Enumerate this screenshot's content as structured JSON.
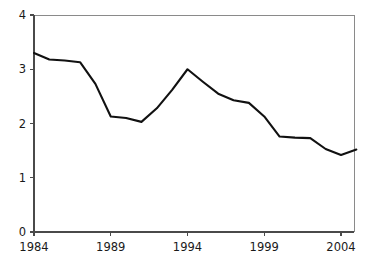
{
  "chart_data": {
    "type": "line",
    "title": "",
    "subtitle": "",
    "xlabel": "",
    "ylabel": "",
    "xlim": [
      1984,
      2005
    ],
    "ylim": [
      0,
      4
    ],
    "grid": false,
    "legend": false,
    "legend_position": "none",
    "x_ticks": [
      1984,
      1989,
      1994,
      1999,
      2004
    ],
    "x_tick_labels": [
      "1984",
      "1989",
      "1994",
      "1999",
      "2004"
    ],
    "y_ticks": [
      0,
      1,
      2,
      3,
      4
    ],
    "y_tick_labels": [
      "0",
      "1",
      "2",
      "3",
      "4"
    ],
    "line_color": "#111111",
    "axis_color": "#4a4a4a",
    "frame_color": "#8a8a8a",
    "series": [
      {
        "name": "series-1",
        "x": [
          1984,
          1985,
          1986,
          1987,
          1988,
          1989,
          1990,
          1991,
          1992,
          1993,
          1994,
          1995,
          1996,
          1997,
          1998,
          1999,
          2000,
          2001,
          2002,
          2003,
          2004,
          2005
        ],
        "values": [
          3.3,
          3.18,
          3.16,
          3.13,
          2.73,
          2.13,
          2.1,
          2.03,
          2.28,
          2.62,
          3.0,
          2.77,
          2.55,
          2.43,
          2.38,
          2.13,
          1.76,
          1.74,
          1.73,
          1.53,
          1.42,
          1.52
        ]
      }
    ],
    "annotations": []
  }
}
